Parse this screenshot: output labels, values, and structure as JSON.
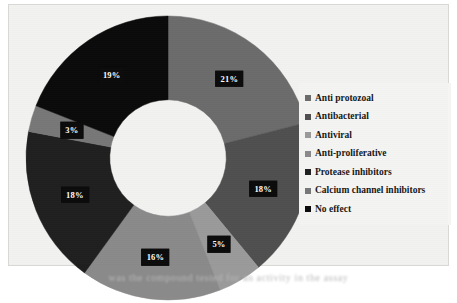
{
  "figure": {
    "background_color": "#f2f2f0",
    "border_color": "#d8d8d4",
    "caption_remnant": "was the compound tested for an activity in the assay"
  },
  "chart_data": {
    "type": "pie",
    "variant": "donut",
    "title": "",
    "xlabel": "",
    "ylabel": "",
    "units": "percent",
    "start_angle_deg": 0,
    "direction": "clockwise",
    "inner_radius_ratio": 0.41,
    "legend_position": "right",
    "grid": false,
    "categories": [
      "Anti protozoal",
      "Antibacterial",
      "Antiviral",
      "Anti-proliferative",
      "Protease inhibitors",
      "Calcium channel inhibitors",
      "No effect"
    ],
    "values": [
      21,
      18,
      5,
      16,
      18,
      3,
      19
    ],
    "data_labels": [
      "21%",
      "18%",
      "5%",
      "16%",
      "18%",
      "3%",
      "19%"
    ],
    "colors": [
      "#6b6b6b",
      "#4f4f4f",
      "#9a9a9a",
      "#8a8a8a",
      "#1f1f1f",
      "#777777",
      "#0a0a0a"
    ],
    "label_text_color": "#ffffff",
    "label_background_color": "#0b0b0b"
  },
  "legend": {
    "items": [
      {
        "label": "Anti protozoal",
        "color": "#6b6b6b"
      },
      {
        "label": "Antibacterial",
        "color": "#4f4f4f"
      },
      {
        "label": "Antiviral",
        "color": "#9a9a9a"
      },
      {
        "label": "Anti-proliferative",
        "color": "#8a8a8a"
      },
      {
        "label": "Protease inhibitors",
        "color": "#1f1f1f"
      },
      {
        "label": "Calcium channel inhibitors",
        "color": "#777777"
      },
      {
        "label": "No effect",
        "color": "#0a0a0a"
      }
    ]
  }
}
